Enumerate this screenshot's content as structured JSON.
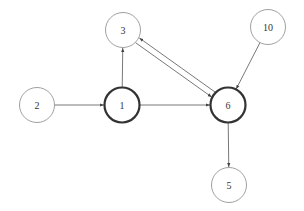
{
  "diagram": {
    "type": "directed-graph",
    "nodes": [
      {
        "id": "3",
        "label": "3",
        "x": 123,
        "y": 30,
        "r": 17.5,
        "emphasized": false
      },
      {
        "id": "10",
        "label": "10",
        "x": 268,
        "y": 27,
        "r": 17.5,
        "emphasized": false
      },
      {
        "id": "2",
        "label": "2",
        "x": 37,
        "y": 105,
        "r": 17.5,
        "emphasized": false
      },
      {
        "id": "1",
        "label": "1",
        "x": 122,
        "y": 105,
        "r": 17.5,
        "emphasized": true
      },
      {
        "id": "6",
        "label": "6",
        "x": 228,
        "y": 105,
        "r": 17.5,
        "emphasized": true
      },
      {
        "id": "5",
        "label": "5",
        "x": 229,
        "y": 185,
        "r": 17.5,
        "emphasized": false
      }
    ],
    "edges": [
      {
        "from": "2",
        "to": "1"
      },
      {
        "from": "1",
        "to": "3"
      },
      {
        "from": "1",
        "to": "6"
      },
      {
        "from": "3",
        "to": "6"
      },
      {
        "from": "6",
        "to": "3"
      },
      {
        "from": "10",
        "to": "6"
      },
      {
        "from": "6",
        "to": "5"
      }
    ],
    "colors": {
      "node_stroke": "#888888",
      "emphasized_stroke": "#333333",
      "edge": "#555555",
      "label": "#333333"
    }
  }
}
